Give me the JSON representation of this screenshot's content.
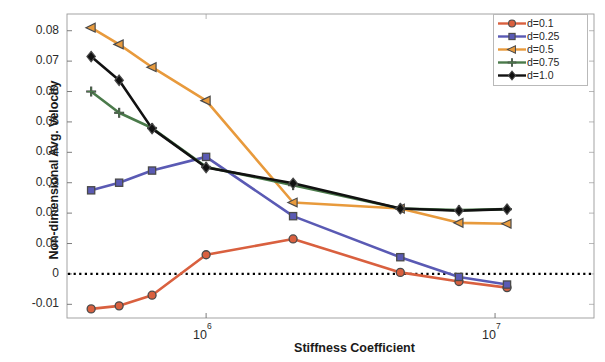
{
  "chart_data": {
    "type": "line",
    "title": "",
    "xlabel": "Stiffness Coefficient",
    "ylabel": "Non-dimensional Avg. Velocity",
    "xscale": "log",
    "xlim": [
      330000,
      22000000
    ],
    "ylim": [
      -0.0145,
      0.0855
    ],
    "grid": false,
    "zero_line": true,
    "legend_position": "top-right",
    "xticks": [
      {
        "value": 1000000,
        "label": "10",
        "exp": "6"
      },
      {
        "value": 10000000,
        "label": "10",
        "exp": "7"
      }
    ],
    "yticks": [
      {
        "value": 0.08,
        "label": "0.08"
      },
      {
        "value": 0.07,
        "label": "0.07"
      },
      {
        "value": 0.06,
        "label": "0.06"
      },
      {
        "value": 0.05,
        "label": "0.05"
      },
      {
        "value": 0.04,
        "label": "0.04"
      },
      {
        "value": 0.03,
        "label": "0.03"
      },
      {
        "value": 0.02,
        "label": "0.02"
      },
      {
        "value": 0.01,
        "label": "0.01"
      },
      {
        "value": 0,
        "label": "0"
      },
      {
        "value": -0.01,
        "label": "-0.01"
      }
    ],
    "x": [
      400000,
      500000,
      650000,
      1000000,
      2000000,
      4700000,
      7500000,
      11000000
    ],
    "series": [
      {
        "name": "d=0.1",
        "label": "d=0.1",
        "color": "#d9603f",
        "marker": "circle",
        "values": [
          -0.0115,
          -0.0105,
          -0.007,
          0.0063,
          0.0115,
          0.0005,
          -0.0025,
          -0.0045
        ]
      },
      {
        "name": "d=0.25",
        "label": "d=0.25",
        "color": "#5a5ab4",
        "marker": "square",
        "values": [
          0.0275,
          0.03,
          0.034,
          0.0385,
          0.019,
          0.0055,
          -0.001,
          -0.0035
        ]
      },
      {
        "name": "d=0.5",
        "label": "d=0.5",
        "color": "#e89a3c",
        "marker": "triangle-left",
        "values": [
          0.081,
          0.0755,
          0.068,
          0.057,
          0.0235,
          0.0215,
          0.0168,
          0.0165
        ]
      },
      {
        "name": "d=0.75",
        "label": "d=0.75",
        "color": "#4a7a4a",
        "marker": "plus",
        "values": [
          0.06,
          0.053,
          0.048,
          0.0352,
          0.0292,
          0.0215,
          0.021,
          0.0213
        ]
      },
      {
        "name": "d=1.0",
        "label": "d=1.0",
        "color": "#111111",
        "marker": "diamond",
        "values": [
          0.0715,
          0.0637,
          0.0478,
          0.035,
          0.0298,
          0.0215,
          0.0208,
          0.0213
        ]
      }
    ]
  }
}
